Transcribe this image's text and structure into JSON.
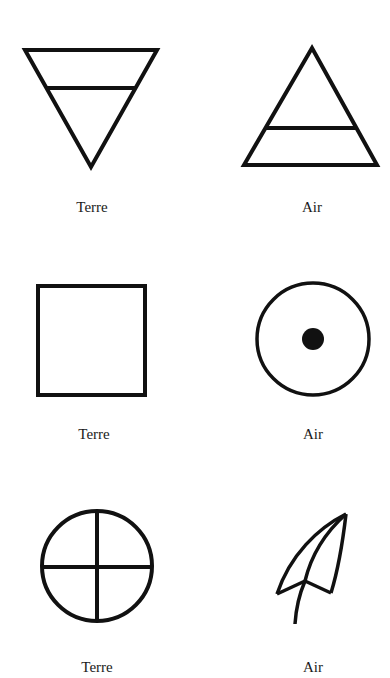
{
  "figure": {
    "stroke_color": "#111111",
    "background": "#ffffff",
    "rows": [
      {
        "left": {
          "symbol": "inverted-triangle-with-bar",
          "label": "Terre"
        },
        "right": {
          "symbol": "triangle-with-bar",
          "label": "Air"
        }
      },
      {
        "left": {
          "symbol": "square",
          "label": "Terre"
        },
        "right": {
          "symbol": "circle-with-dot",
          "label": "Air"
        }
      },
      {
        "left": {
          "symbol": "circle-with-cross",
          "label": "Terre"
        },
        "right": {
          "symbol": "feather-leaf",
          "label": "Air"
        }
      }
    ]
  }
}
